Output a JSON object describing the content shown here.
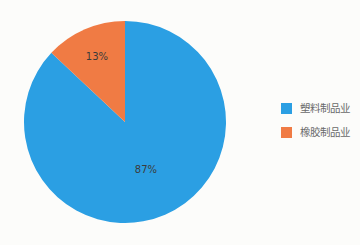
{
  "chart_data": {
    "type": "pie",
    "title": "",
    "legend_position": "right",
    "start_angle_deg": 0,
    "direction": "clockwise",
    "background_color": "#fcfcfa",
    "slices": [
      {
        "label": "塑料制品业",
        "value": 87,
        "percent_label": "87%",
        "color": "#2b9fe3"
      },
      {
        "label": "橡胶制品业",
        "value": 13,
        "percent_label": "13%",
        "color": "#f07b44"
      }
    ]
  }
}
